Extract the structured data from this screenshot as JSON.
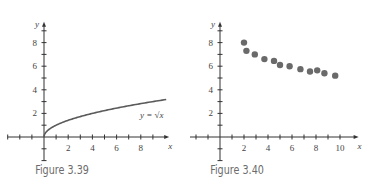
{
  "figures": [
    {
      "caption": "Figure 3.39",
      "x_axis_label": "x",
      "y_axis_label": "y",
      "curve_label": "y = √x",
      "x_ticks": [
        "2",
        "4",
        "6",
        "8"
      ],
      "y_ticks": [
        "2",
        "4",
        "6",
        "8"
      ]
    },
    {
      "caption": "Figure 3.40",
      "x_axis_label": "x",
      "y_axis_label": "y",
      "x_ticks": [
        "2",
        "4",
        "6",
        "8",
        "10"
      ],
      "y_ticks": [
        "2",
        "4",
        "6",
        "8"
      ]
    }
  ],
  "colors": {
    "curve": "#5a5a5a",
    "points": "#6a6a6a",
    "axis": "#333333",
    "caption": "#6b6b6b"
  },
  "chart_data": [
    {
      "type": "line",
      "title": "Figure 3.39",
      "xlabel": "x",
      "ylabel": "y",
      "function": "y = sqrt(x)",
      "x": [
        0,
        1,
        2,
        3,
        4,
        5,
        6,
        7,
        8,
        9,
        10
      ],
      "values": [
        0,
        1,
        1.414,
        1.732,
        2,
        2.236,
        2.449,
        2.646,
        2.828,
        3,
        3.162
      ],
      "xlim": [
        -1,
        10
      ],
      "ylim": [
        -2,
        9
      ],
      "x_ticks": [
        2,
        4,
        6,
        8
      ],
      "y_ticks": [
        2,
        4,
        6,
        8
      ],
      "annotations": [
        "y = √x"
      ],
      "grid": false,
      "legend": "none"
    },
    {
      "type": "scatter",
      "title": "Figure 3.40",
      "xlabel": "x",
      "ylabel": "y",
      "x": [
        2.0,
        2.2,
        2.9,
        3.7,
        4.5,
        5.0,
        5.8,
        6.7,
        7.5,
        8.1,
        8.7,
        9.6
      ],
      "values": [
        8.0,
        7.3,
        7.0,
        6.6,
        6.45,
        6.1,
        6.0,
        5.75,
        5.55,
        5.65,
        5.4,
        5.2
      ],
      "xlim": [
        -1,
        11
      ],
      "ylim": [
        -2,
        9
      ],
      "x_ticks": [
        2,
        4,
        6,
        8,
        10
      ],
      "y_ticks": [
        2,
        4,
        6,
        8
      ],
      "grid": false,
      "legend": "none"
    }
  ]
}
